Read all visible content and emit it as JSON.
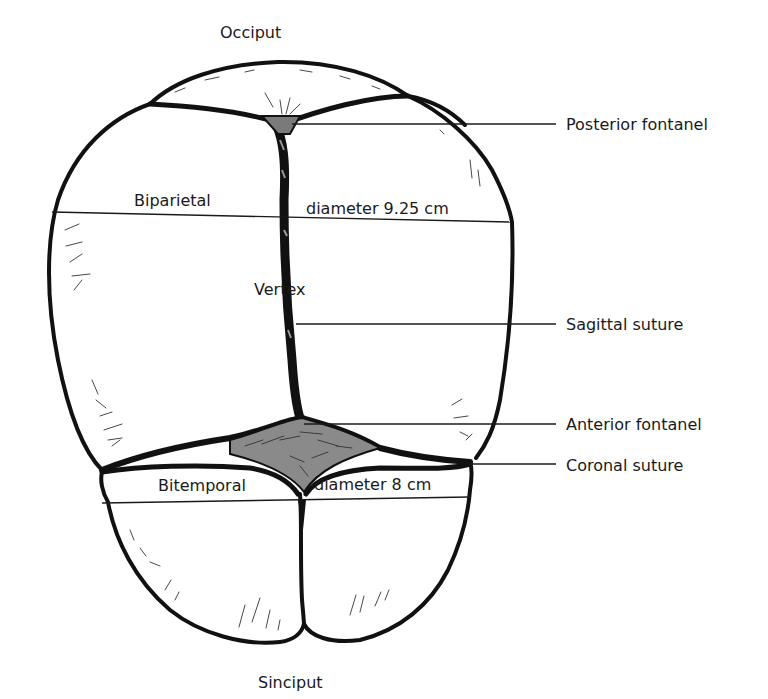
{
  "figure": {
    "colors": {
      "ink": "#111111",
      "background": "#ffffff",
      "fontanel_fill": "#7a7a7a"
    }
  },
  "landmarks": {
    "top": "Occiput",
    "bottom": "Sinciput",
    "center": "Vertex"
  },
  "diameters": {
    "biparietal": {
      "left_label": "Biparietal",
      "right_label": "diameter 9.25 cm",
      "value_cm": 9.25
    },
    "bitemporal": {
      "left_label": "Bitemporal",
      "right_label": "diameter 8 cm",
      "value_cm": 8
    }
  },
  "callouts": [
    {
      "label": "Posterior fontanel"
    },
    {
      "label": "Sagittal suture"
    },
    {
      "label": "Anterior fontanel"
    },
    {
      "label": "Coronal suture"
    }
  ]
}
